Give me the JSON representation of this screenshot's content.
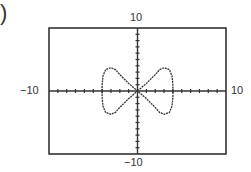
{
  "prefix": ")",
  "chart_data": {
    "type": "line",
    "title": "",
    "xlabel": "",
    "ylabel": "",
    "xlim": [
      -10,
      10
    ],
    "ylim": [
      -10,
      10
    ],
    "grid": false,
    "x_tick_step": 1,
    "y_tick_step": 1,
    "labels": {
      "top": "10",
      "bottom": "-10",
      "left": "-10",
      "right": "10"
    },
    "display_labels": {
      "top": "10",
      "bottom": "−10",
      "left": "−10",
      "right": "10"
    },
    "series": [
      {
        "name": "curve",
        "points": [
          [
            0,
            0
          ],
          [
            1,
            1.2
          ],
          [
            2,
            2.6
          ],
          [
            2.5,
            3.4
          ],
          [
            3,
            3.7
          ],
          [
            3.6,
            3.4
          ],
          [
            3.9,
            2.4
          ],
          [
            4,
            1
          ],
          [
            4,
            0
          ],
          [
            4,
            -1
          ],
          [
            3.9,
            -2.4
          ],
          [
            3.6,
            -3.4
          ],
          [
            3,
            -3.7
          ],
          [
            2.5,
            -3.4
          ],
          [
            2,
            -2.6
          ],
          [
            1,
            -1.2
          ],
          [
            0,
            0
          ],
          [
            -1,
            1.2
          ],
          [
            -2,
            2.6
          ],
          [
            -2.5,
            3.4
          ],
          [
            -3,
            3.7
          ],
          [
            -3.6,
            3.4
          ],
          [
            -3.9,
            2.4
          ],
          [
            -4,
            1
          ],
          [
            -4,
            0
          ],
          [
            -4,
            -1
          ],
          [
            -3.9,
            -2.4
          ],
          [
            -3.6,
            -3.4
          ],
          [
            -3,
            -3.7
          ],
          [
            -2.5,
            -3.4
          ],
          [
            -2,
            -2.6
          ],
          [
            -1,
            -1.2
          ],
          [
            0,
            0
          ]
        ]
      }
    ]
  }
}
